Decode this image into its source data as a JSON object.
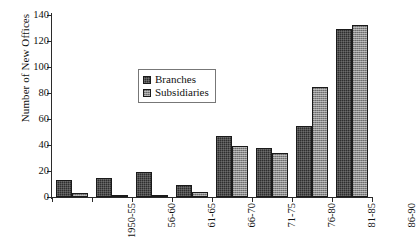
{
  "chart_data": {
    "type": "bar",
    "title": "",
    "subtitle": "",
    "xlabel": "",
    "ylabel": "Number of New Offices",
    "ylim": [
      0,
      140
    ],
    "yticks": [
      0,
      20,
      40,
      60,
      80,
      100,
      120,
      140
    ],
    "grid": false,
    "legend_position": "inside-center-left",
    "categories": [
      "1950-55",
      "56-60",
      "61-65",
      "66-70",
      "71-75",
      "76-80",
      "81-85",
      "86-90"
    ],
    "series": [
      {
        "name": "Branches",
        "color": "#2e2e2e",
        "values": [
          13,
          15,
          19,
          9,
          47,
          38,
          55,
          129
        ]
      },
      {
        "name": "Subsidiaries",
        "color": "#8a8a8a",
        "values": [
          3,
          1,
          1,
          4,
          39,
          34,
          85,
          132
        ]
      }
    ]
  },
  "axes": {
    "y_title": "Number of New Offices",
    "y_tick_labels": [
      "0",
      "20",
      "40",
      "60",
      "80",
      "100",
      "120",
      "140"
    ],
    "x_tick_labels": [
      "1950-55",
      "56-60",
      "61-65",
      "66-70",
      "71-75",
      "76-80",
      "81-85",
      "86-90"
    ]
  },
  "legend": {
    "entries": [
      {
        "label": "Branches",
        "color": "#2e2e2e"
      },
      {
        "label": "Subsidiaries",
        "color": "#8a8a8a"
      }
    ]
  }
}
